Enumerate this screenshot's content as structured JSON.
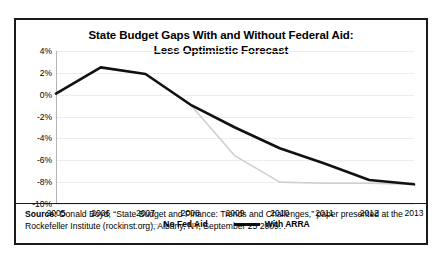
{
  "chart_data": {
    "type": "line",
    "title": "State Budget Gaps With and Without Federal Aid:",
    "subtitle": "Less Optimistic Forecast",
    "xlabel": "",
    "ylabel": "",
    "x": [
      2005,
      2006,
      2007,
      2008,
      2009,
      2010,
      2011,
      2012,
      2013
    ],
    "categories": [
      "2005",
      "2006",
      "2007",
      "2008",
      "2009",
      "2010",
      "2011",
      "2012",
      "2013"
    ],
    "ytick_labels": [
      "4%",
      "2%",
      "0%",
      "-2%",
      "-4%",
      "-6%",
      "-8%",
      "-10%"
    ],
    "ytick_values": [
      4,
      2,
      0,
      -2,
      -4,
      -6,
      -8,
      -10
    ],
    "ylim": [
      -10,
      4
    ],
    "xlim": [
      2005,
      2013
    ],
    "grid": true,
    "legend_position": "bottom",
    "series": [
      {
        "name": "No Fed Aid",
        "color": "#cfcfcf",
        "width": 1.6,
        "values": [
          0.1,
          2.5,
          1.9,
          -0.9,
          -5.6,
          -8.0,
          -8.1,
          -8.1,
          -8.2
        ]
      },
      {
        "name": "With ARRA",
        "color": "#111111",
        "width": 2.6,
        "values": [
          0.1,
          2.5,
          1.9,
          -0.9,
          -3.0,
          -4.9,
          -6.3,
          -7.8,
          -8.2
        ]
      }
    ]
  },
  "source": {
    "label": "Source:",
    "text": " Donald Boyd, “State Budget and Finance: Trends and Challenges,” paper presented at the Rockefeller Institute (rockinst.org), Albany, NY, September 25 2009. ."
  }
}
